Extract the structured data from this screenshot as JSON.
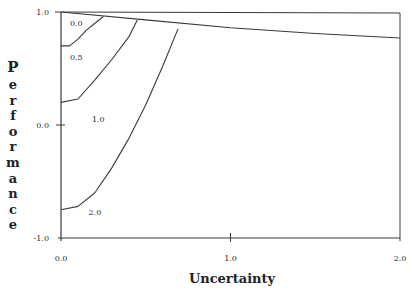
{
  "chart_data": {
    "type": "line",
    "title": "",
    "xlabel": "Uncertainty",
    "ylabel": "Performance",
    "xlim": [
      0.0,
      2.0
    ],
    "ylim": [
      -1.0,
      1.0
    ],
    "x_ticks": [
      "0.0",
      "1.0",
      "2.0"
    ],
    "y_ticks": [
      "1.0",
      "0.0",
      "-1.0"
    ],
    "grid": false,
    "legend": "none",
    "series": [
      {
        "name": "envelope",
        "x": [
          0.0,
          0.5,
          1.0,
          1.5,
          2.0
        ],
        "y": [
          1.0,
          0.93,
          0.86,
          0.81,
          0.77
        ]
      },
      {
        "name": "boundary 0.0/0.5",
        "x": [
          0.0,
          0.05,
          0.1,
          0.15,
          0.2,
          0.25
        ],
        "y": [
          0.7,
          0.7,
          0.76,
          0.84,
          0.9,
          0.96
        ]
      },
      {
        "name": "boundary 0.5/1.0",
        "x": [
          0.0,
          0.1,
          0.2,
          0.3,
          0.4,
          0.45
        ],
        "y": [
          0.2,
          0.23,
          0.4,
          0.58,
          0.78,
          0.93
        ]
      },
      {
        "name": "boundary 1.0/2.0",
        "x": [
          0.0,
          0.1,
          0.2,
          0.3,
          0.4,
          0.5,
          0.6,
          0.69
        ],
        "y": [
          -0.75,
          -0.72,
          -0.6,
          -0.38,
          -0.12,
          0.18,
          0.52,
          0.85
        ]
      }
    ],
    "region_labels": [
      {
        "text": "0.0",
        "x": 0.09,
        "y": 0.9
      },
      {
        "text": "0.5",
        "x": 0.09,
        "y": 0.6
      },
      {
        "text": "1.0",
        "x": 0.22,
        "y": 0.05
      },
      {
        "text": "2.0",
        "x": 0.2,
        "y": -0.77
      }
    ]
  },
  "axes": {
    "xlabel": "Uncertainty",
    "ylabel_letters": [
      "P",
      "e",
      "r",
      "f",
      "o",
      "r",
      "m",
      "a",
      "n",
      "c",
      "e"
    ],
    "x_ticks": [
      {
        "label": "0.0",
        "value": 0.0
      },
      {
        "label": "1.0",
        "value": 1.0
      },
      {
        "label": "2.0",
        "value": 2.0
      }
    ],
    "y_ticks": [
      {
        "label": "1.0",
        "value": 1.0
      },
      {
        "label": "0.0",
        "value": 0.0
      },
      {
        "label": "-1.0",
        "value": -1.0
      }
    ]
  },
  "colors": {
    "line": "#3a3a3a",
    "text": "#2a2a2a",
    "background": "#ffffff"
  }
}
